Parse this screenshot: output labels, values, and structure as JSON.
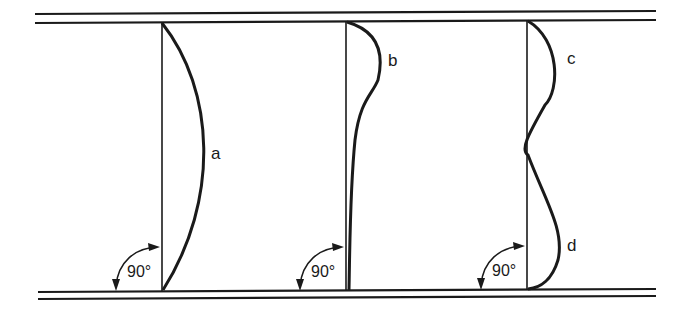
{
  "diagram": {
    "type": "column buckling mode shapes between two parallel plates",
    "colors": {
      "line": "#1a1a1a",
      "background": "#ffffff"
    },
    "columns": [
      {
        "id": "a",
        "label": "a",
        "angle_label": "90°",
        "shape": "single bow curve"
      },
      {
        "id": "b",
        "label": "b",
        "angle_label": "90°",
        "shape": "bulge near top, tapering to base"
      },
      {
        "id": "c",
        "label": "c",
        "shape": "upper half-wave"
      },
      {
        "id": "d",
        "label": "d",
        "angle_label": "90°",
        "shape": "lower half-wave"
      }
    ],
    "angles": [
      "90°",
      "90°",
      "90°"
    ]
  }
}
